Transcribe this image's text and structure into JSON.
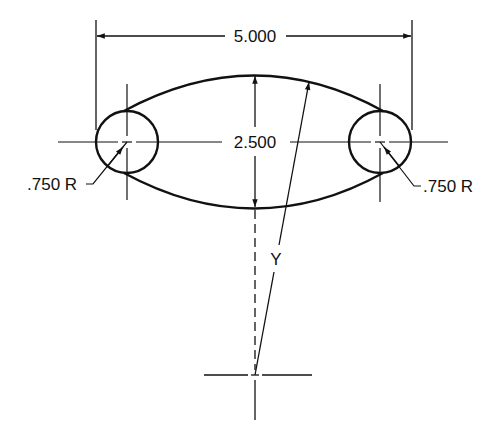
{
  "diagram": {
    "type": "engineering-drawing",
    "colors": {
      "line": "#111111",
      "background": "#ffffff"
    },
    "dimensions": {
      "overall_width": "5.000",
      "center_height": "2.500",
      "left_radius": ".750 R",
      "right_radius": ".750 R",
      "arc_radius": "Y"
    }
  }
}
